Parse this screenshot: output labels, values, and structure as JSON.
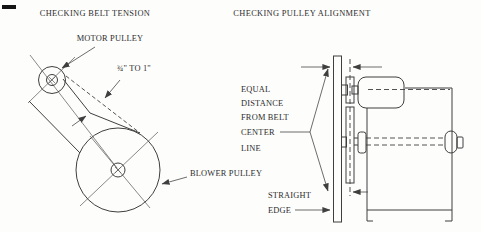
{
  "page": {
    "background": "#fdfdfc",
    "line_color": "#3f3f3f",
    "text_color": "#2d2d2d"
  },
  "left_diagram": {
    "title": "CHECKING BELT TENSION",
    "labels": {
      "motor_pulley": "MOTOR PULLEY",
      "deflection": "¾\" TO 1\"",
      "blower_pulley": "BLOWER PULLEY"
    }
  },
  "right_diagram": {
    "title": "CHECKING PULLEY ALIGNMENT",
    "labels": {
      "equal_distance_lines": [
        "EQUAL",
        "DISTANCE",
        "FROM BELT",
        "CENTER",
        "LINE"
      ],
      "straight_edge_lines": [
        "STRAIGHT",
        "EDGE"
      ]
    }
  }
}
